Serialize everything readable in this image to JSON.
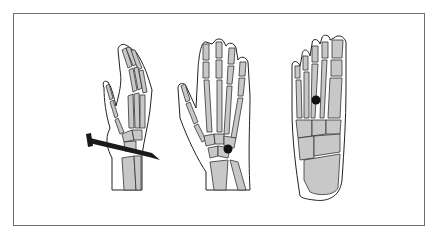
{
  "figure": {
    "title": "",
    "panels": [
      {
        "id": "lateral-hand",
        "label": "",
        "description": "Lateral view of hand skeleton with nail piercing wrist",
        "marker": "nail"
      },
      {
        "id": "palmar-hand",
        "label": "",
        "description": "Palmar view of hand skeleton with dot marking carpal bones",
        "marker": "dot"
      },
      {
        "id": "foot-dorsal",
        "label": "",
        "description": "Dorsal view of foot skeleton with dot between metatarsals",
        "marker": "dot"
      }
    ],
    "colors": {
      "bone": "#c8c8c8",
      "outline": "#222222",
      "frame": "#6e6e6e",
      "marker": "#111111"
    }
  }
}
